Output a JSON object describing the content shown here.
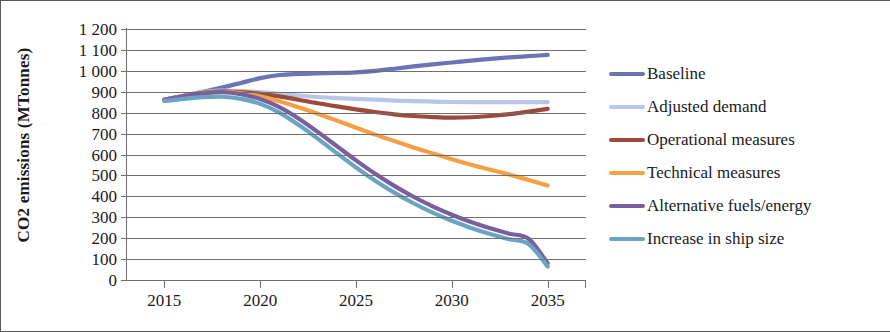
{
  "chart_data": {
    "type": "line",
    "title": "",
    "xlabel": "",
    "ylabel": "CO2 emissions (MTonnes)",
    "xlim": [
      2013,
      2037
    ],
    "ylim": [
      0,
      1200
    ],
    "grid": true,
    "legend_position": "right",
    "x_tick_labels": [
      "2015",
      "2020",
      "2025",
      "2030",
      "2035"
    ],
    "x_ticks": [
      2015,
      2020,
      2025,
      2030,
      2035
    ],
    "y_tick_labels": [
      "1 200",
      "1 100",
      "1 000",
      "900",
      "800",
      "700",
      "600",
      "500",
      "400",
      "300",
      "200",
      "100",
      "0"
    ],
    "y_ticks": [
      1200,
      1100,
      1000,
      900,
      800,
      700,
      600,
      500,
      400,
      300,
      200,
      100,
      0
    ],
    "x": [
      2015,
      2016,
      2017,
      2018,
      2019,
      2020,
      2021,
      2022,
      2023,
      2024,
      2025,
      2026,
      2027,
      2028,
      2029,
      2030,
      2031,
      2032,
      2033,
      2034,
      2035
    ],
    "series": [
      {
        "name": "Baseline",
        "color": "#6b74b4",
        "values": [
          862,
          880,
          900,
          920,
          942,
          965,
          980,
          985,
          988,
          990,
          993,
          1000,
          1010,
          1021,
          1031,
          1040,
          1049,
          1057,
          1064,
          1070,
          1076
        ]
      },
      {
        "name": "Adjusted demand",
        "color": "#b9c6e8",
        "values": [
          862,
          880,
          898,
          905,
          903,
          898,
          890,
          882,
          875,
          870,
          866,
          862,
          858,
          855,
          853,
          851,
          850,
          850,
          850,
          850,
          850
        ]
      },
      {
        "name": "Operational measures",
        "color": "#9c4a3c",
        "values": [
          862,
          879,
          895,
          902,
          898,
          890,
          878,
          862,
          845,
          830,
          816,
          803,
          792,
          784,
          779,
          776,
          778,
          784,
          793,
          805,
          818
        ]
      },
      {
        "name": "Technical measures",
        "color": "#f5a044",
        "values": [
          862,
          878,
          893,
          900,
          893,
          878,
          855,
          826,
          795,
          762,
          728,
          695,
          664,
          634,
          605,
          577,
          551,
          527,
          504,
          478,
          452
        ]
      },
      {
        "name": "Alternative fuels/energy",
        "color": "#7b5ea0",
        "values": [
          862,
          878,
          892,
          898,
          888,
          865,
          826,
          772,
          708,
          640,
          572,
          508,
          450,
          398,
          352,
          312,
          277,
          247,
          221,
          197,
          80
        ]
      },
      {
        "name": "Increase in ship size",
        "color": "#6aa4c4",
        "values": [
          856,
          866,
          874,
          876,
          866,
          842,
          800,
          742,
          676,
          606,
          538,
          475,
          418,
          367,
          322,
          283,
          249,
          220,
          195,
          172,
          65
        ]
      }
    ]
  },
  "axes": {
    "y_title": "CO2 emissions (MTonnes)"
  },
  "legend": {
    "items": [
      {
        "label": "Baseline",
        "color": "#6b74b4"
      },
      {
        "label": "Adjusted demand",
        "color": "#b9c6e8"
      },
      {
        "label": "Operational measures",
        "color": "#9c4a3c"
      },
      {
        "label": "Technical measures",
        "color": "#f5a044"
      },
      {
        "label": "Alternative fuels/energy",
        "color": "#7b5ea0"
      },
      {
        "label": "Increase in ship size",
        "color": "#6aa4c4"
      }
    ]
  }
}
